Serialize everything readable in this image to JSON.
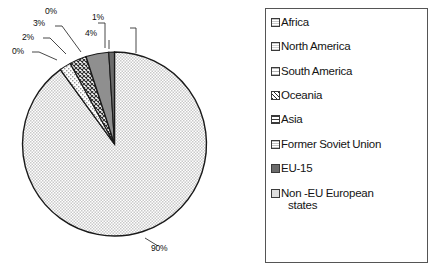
{
  "chart_data": {
    "type": "pie",
    "title": "",
    "categories": [
      "Africa",
      "North America",
      "South America",
      "Oceania",
      "Asia",
      "Former Soviet Union",
      "EU-15",
      "Non -EU European states"
    ],
    "values": [
      90,
      0,
      2,
      3,
      0,
      4,
      1,
      0
    ],
    "value_labels": [
      "90%",
      "0%",
      "2%",
      "3%",
      "0%",
      "4%",
      "1%",
      "0%"
    ],
    "units": "percent",
    "legend_position": "right",
    "grid": false,
    "slice_order_clockwise_from_top": [
      "Africa",
      "North America",
      "South America",
      "Oceania",
      "Asia",
      "Former Soviet Union",
      "EU-15",
      "Non -EU European states"
    ],
    "slices": [
      {
        "label": "Africa",
        "value": 90,
        "display": "90%",
        "fill": "fine-dot-light",
        "color": "#d8d8d8"
      },
      {
        "label": "North America",
        "value": 0,
        "display": "0%",
        "fill": "fine-dot-light",
        "color": "#dcdcdc"
      },
      {
        "label": "South America",
        "value": 2,
        "display": "2%",
        "fill": "sparse-dot",
        "color": "#e2e2e2"
      },
      {
        "label": "Oceania",
        "value": 3,
        "display": "3%",
        "fill": "crosshatch-dense",
        "color": "#c0c0c0"
      },
      {
        "label": "Asia",
        "value": 0,
        "display": "0%",
        "fill": "grid-lines",
        "color": "#b8b8b8"
      },
      {
        "label": "Former Soviet Union",
        "value": 4,
        "display": "4%",
        "fill": "mid-gray-solid",
        "color": "#8f8f8f"
      },
      {
        "label": "EU-15",
        "value": 1,
        "display": "1%",
        "fill": "dark-gray-solid",
        "color": "#6b6b6b"
      },
      {
        "label": "Non -EU European states",
        "value": 0,
        "display": "0%",
        "fill": "light-gray-solid",
        "color": "#cfcfcf"
      }
    ]
  },
  "legend": {
    "items": [
      {
        "label": "Africa",
        "swatch": "fine-dot-light"
      },
      {
        "label": "North America",
        "swatch": "fine-dot-light"
      },
      {
        "label": "South America",
        "swatch": "sparse-dot"
      },
      {
        "label": "Oceania",
        "swatch": "crosshatch-dense"
      },
      {
        "label": "Asia",
        "swatch": "grid-lines"
      },
      {
        "label": "Former Soviet Union",
        "swatch": "fine-dot-light"
      },
      {
        "label": "EU-15",
        "swatch": "dark-gray-solid"
      },
      {
        "label": "Non -EU European states",
        "swatch": "light-gray-solid",
        "line1": "Non -EU European",
        "line2": "states"
      }
    ]
  },
  "pie_labels": {
    "l_0_first": "0%",
    "l_2": "2%",
    "l_3": "3%",
    "l_0_second": "0%",
    "l_4": "4%",
    "l_1": "1%",
    "l_90": "90%"
  },
  "colors": {
    "outline": "#1a1a1a",
    "legend_border": "#555555",
    "background": "#ffffff"
  }
}
